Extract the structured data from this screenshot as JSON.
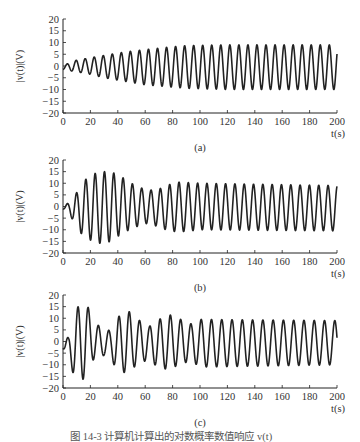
{
  "figure": {
    "caption": "图 14-3  计算机计算出的对数概率数值响应 v(t)",
    "ink_color": "#222222"
  },
  "chart_data": [
    {
      "type": "line",
      "panel_label": "(a)",
      "title": "",
      "xlabel": "t(s)",
      "ylabel": "|v(t)|(V)",
      "xlim": [
        0,
        200
      ],
      "ylim": [
        -20,
        20
      ],
      "xticks": [
        0,
        20,
        40,
        60,
        80,
        100,
        120,
        140,
        160,
        180,
        200
      ],
      "yticks": [
        20,
        15,
        10,
        5,
        0,
        -5,
        -10,
        -15,
        -20
      ],
      "grid": false,
      "period_s": 6.6,
      "envelope": {
        "t": [
          0,
          5,
          10,
          20,
          30,
          40,
          50,
          60,
          70,
          80,
          90,
          120,
          200
        ],
        "upper": [
          0,
          1.5,
          2.5,
          3.5,
          4.5,
          5.5,
          6.3,
          7,
          7.6,
          8.2,
          8.7,
          9,
          9
        ],
        "lower": [
          -1.5,
          -2,
          -2.5,
          -3.5,
          -5,
          -6,
          -7,
          -8,
          -8.5,
          -9,
          -9.5,
          -10,
          -10
        ]
      },
      "summary": "oscillation growing from ~±1.5 V to steady ~+9/-10 V by ~100 s"
    },
    {
      "type": "line",
      "panel_label": "(b)",
      "title": "",
      "xlabel": "t(s)",
      "ylabel": "|v(t)|(V)",
      "xlim": [
        0,
        200
      ],
      "ylim": [
        -20,
        20
      ],
      "xticks": [
        0,
        20,
        40,
        60,
        80,
        100,
        120,
        140,
        160,
        180,
        200
      ],
      "yticks": [
        20,
        15,
        10,
        5,
        0,
        -5,
        -10,
        -15,
        -20
      ],
      "grid": false,
      "period_s": 6.8,
      "envelope": {
        "t": [
          0,
          5,
          10,
          15,
          22,
          28,
          35,
          42,
          50,
          57,
          63,
          70,
          78,
          85,
          100,
          200
        ],
        "upper": [
          0,
          2,
          6,
          11,
          14,
          15,
          15,
          13,
          10,
          8,
          7,
          7.5,
          9.5,
          10.5,
          10,
          9
        ],
        "lower": [
          -1,
          -3.5,
          -9,
          -13,
          -15,
          -16,
          -15,
          -12,
          -9.5,
          -8,
          -7,
          -9,
          -10.5,
          -11,
          -10,
          -10.5
        ]
      },
      "summary": "large transient reaching ~±15 V around 25-35 s, dip near 60 s, settles ~+9/-10 V"
    },
    {
      "type": "line",
      "panel_label": "(c)",
      "title": "",
      "xlabel": "t(s)",
      "ylabel": "|v(t)|(V)",
      "xlim": [
        0,
        200
      ],
      "ylim": [
        -20,
        20
      ],
      "xticks": [
        0,
        20,
        40,
        60,
        80,
        100,
        120,
        140,
        160,
        180,
        200
      ],
      "yticks": [
        20,
        15,
        10,
        5,
        0,
        -5,
        -10,
        -15,
        -20
      ],
      "grid": false,
      "period_s": 7.5,
      "envelope": {
        "t": [
          0,
          4,
          9,
          13,
          16,
          20,
          24,
          30,
          35,
          40,
          47,
          52,
          56,
          63,
          70,
          78,
          86,
          94,
          100,
          200
        ],
        "upper": [
          0,
          2,
          13,
          17,
          17,
          13,
          8,
          4.5,
          5,
          10.5,
          13.5,
          11,
          9,
          6.5,
          9.5,
          11.5,
          9.5,
          7.5,
          9.5,
          9
        ],
        "lower": [
          -3,
          -8.5,
          -16,
          -16.5,
          -16,
          -9,
          -7,
          -6,
          -7.5,
          -13,
          -13.5,
          -11,
          -9,
          -8,
          -11.5,
          -12,
          -9.5,
          -8.5,
          -11,
          -10
        ]
      },
      "summary": "strong early transient ~±17 V at 12-20 s, beating envelope, settles ~+9/-10 V"
    }
  ]
}
